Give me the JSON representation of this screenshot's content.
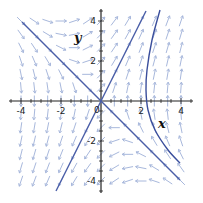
{
  "chart_data": {
    "type": "line",
    "subtype": "phase-portrait",
    "title": "",
    "xlabel": "x",
    "ylabel": "y",
    "origin_label": "0",
    "xlim": [
      -4.6,
      4.6
    ],
    "ylim": [
      -4.6,
      4.6
    ],
    "x_ticks": [
      -4,
      -2,
      2,
      4
    ],
    "y_ticks": [
      -4,
      -2,
      2,
      4
    ],
    "x_tick_labels": [
      "-4",
      "-2",
      "2",
      "4"
    ],
    "y_tick_labels": [
      "-4",
      "-2",
      "2",
      "4"
    ],
    "minor_tick_step": 0.5,
    "grid": false,
    "vector_field": {
      "equations": "x' = y, y' = 2x + y",
      "a": 0,
      "b": 1,
      "c": 2,
      "d": 1,
      "grid_range": [
        -4,
        4
      ],
      "grid_count": 13,
      "color": "#a8b8dc"
    },
    "series": [
      {
        "name": "eigenline-y=-x",
        "color": "#4a5ea8",
        "points": [
          [
            -3.95,
            3.95
          ],
          [
            3.95,
            -3.95
          ]
        ]
      },
      {
        "name": "eigenline-y=2x",
        "color": "#4a5ea8",
        "points": [
          [
            -2.25,
            -4.5
          ],
          [
            2.25,
            4.5
          ]
        ]
      },
      {
        "name": "trajectory",
        "color": "#3a4e9c",
        "points": [
          [
            2.95,
            4.55
          ],
          [
            2.55,
            3.05
          ],
          [
            2.3,
            1.55
          ],
          [
            2.25,
            0.55
          ],
          [
            2.35,
            -0.45
          ],
          [
            2.7,
            -1.45
          ],
          [
            3.35,
            -2.45
          ],
          [
            3.95,
            -3.1
          ]
        ]
      }
    ],
    "annotations": [
      {
        "text": "y",
        "x": -1.35,
        "y": 2.95
      },
      {
        "text": "x",
        "x": 2.85,
        "y": -1.35
      }
    ],
    "axis_color": "#222222"
  }
}
